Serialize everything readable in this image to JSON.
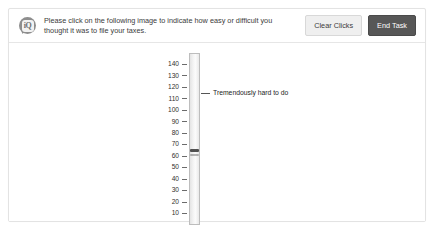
{
  "card": {
    "header": {
      "icon": "speech-bubble-iq-icon",
      "prompt": "Please click on the following image to indicate how easy or difficult you thought it was to file your taxes.",
      "buttons": [
        {
          "label": "Clear Clicks",
          "name": "clear-clicks-button",
          "style": "secondary"
        },
        {
          "label": "End Task",
          "name": "end-task-button",
          "style": "dark"
        }
      ]
    }
  },
  "chart_data": {
    "type": "bar",
    "title": "",
    "xlabel": "",
    "ylabel": "",
    "orientation": "vertical",
    "grid": false,
    "legend_position": "none",
    "ylim": [
      0,
      150
    ],
    "tick_labels": [
      "140",
      "130",
      "120",
      "110",
      "100",
      "90",
      "80",
      "70",
      "60",
      "50",
      "40",
      "30",
      "20",
      "10"
    ],
    "tick_values": [
      140,
      130,
      120,
      110,
      100,
      90,
      80,
      70,
      60,
      50,
      40,
      30,
      20,
      10
    ],
    "annotations": [
      {
        "text": "Tremendously hard to do",
        "value": 115
      }
    ],
    "clicks": [
      {
        "value": 65
      },
      {
        "value": 61
      }
    ]
  },
  "colors": {
    "card_border": "#e3e3e3",
    "divider": "#e6e6e6",
    "text": "#3b3b3b",
    "btn_secondary_bg": "#efefef",
    "btn_dark_bg": "#575757",
    "scale_border": "#bdbdbd",
    "tick": "#6b6b6b",
    "marker": "#3a3a3a"
  }
}
